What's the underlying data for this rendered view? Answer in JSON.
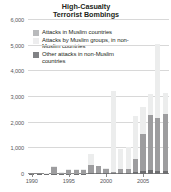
{
  "chart": {
    "title_line1": "High-Casualty",
    "title_line2": "Terrorist Bombings"
  },
  "legend": {
    "items": [
      {
        "label": "Attacks in Muslim countries",
        "swatch": "#b9babc",
        "key": "muslim"
      },
      {
        "label": "Attacks by Muslim groups, in non-Muslim countries",
        "swatch": "#ededee",
        "key": "by_muslim_groups_non_muslim"
      },
      {
        "label": "Other attacks in non-Muslim countries",
        "swatch": "#818285",
        "key": "other_non_muslim"
      }
    ]
  },
  "axes": {
    "y_ticks": [
      "0",
      "1,000",
      "2,000",
      "3,000",
      "4,000",
      "5,000",
      "6,000"
    ],
    "x_ticks": [
      "1990",
      "1995",
      "2000",
      "2005"
    ]
  },
  "chart_data": {
    "type": "bar",
    "subtype": "stacked",
    "title": "High-Casualty Terrorist Bombings",
    "xlabel": "",
    "ylabel": "",
    "ylim": [
      0,
      6000
    ],
    "ytick_values": [
      0,
      1000,
      2000,
      3000,
      4000,
      5000,
      6000
    ],
    "grid": "horizontal",
    "legend_position": "top-left-inside",
    "categories": [
      1990,
      1991,
      1992,
      1993,
      1994,
      1995,
      1996,
      1997,
      1998,
      1999,
      2000,
      2001,
      2002,
      2003,
      2004,
      2005,
      2006,
      2007,
      2008
    ],
    "xtick_labels": [
      "1990",
      "1995",
      "2000",
      "2005"
    ],
    "xtick_values": [
      1990,
      1995,
      2000,
      2005
    ],
    "series": [
      {
        "name": "Attacks in Muslim countries",
        "color": "#9d9d9f",
        "values": [
          10,
          10,
          15,
          270,
          40,
          120,
          150,
          130,
          330,
          280,
          180,
          60,
          150,
          170,
          520,
          1450,
          2150,
          2100,
          2200
        ]
      },
      {
        "name": "Attacks by Muslim groups, in non-Muslim countries",
        "color": "#eceded",
        "values": [
          5,
          5,
          10,
          20,
          30,
          60,
          40,
          30,
          430,
          20,
          40,
          3150,
          780,
          830,
          1700,
          1050,
          800,
          2850,
          830
        ]
      },
      {
        "name": "Other attacks in non-Muslim countries",
        "color": "#6e6f71",
        "values": [
          5,
          5,
          5,
          10,
          10,
          20,
          20,
          20,
          30,
          30,
          30,
          30,
          30,
          40,
          60,
          110,
          160,
          100,
          120
        ]
      }
    ],
    "totals": [
      20,
      20,
      30,
      300,
      80,
      200,
      210,
      180,
      790,
      330,
      250,
      3240,
      960,
      1040,
      2280,
      2610,
      3110,
      5050,
      3150
    ]
  }
}
